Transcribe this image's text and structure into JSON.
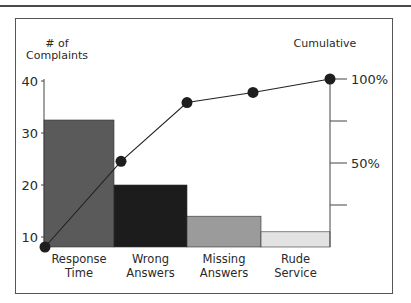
{
  "chart_data": {
    "type": "bar",
    "subtype": "pareto",
    "title": "",
    "categories": [
      "Response Time",
      "Wrong Answers",
      "Missing Answers",
      "Rude Service"
    ],
    "category_lines": [
      [
        "Response",
        "Time"
      ],
      [
        "Wrong",
        "Answers"
      ],
      [
        "Missing",
        "Answers"
      ],
      [
        "Rude",
        "Service"
      ]
    ],
    "series": [
      {
        "name": "# of Complaints",
        "type": "bar",
        "axis": "left",
        "values": [
          32.5,
          20,
          14,
          11
        ],
        "colors": [
          "#5a5a5a",
          "#1c1c1c",
          "#9b9b9b",
          "#e2e2e2"
        ]
      },
      {
        "name": "Cumulative",
        "type": "line",
        "axis": "right",
        "unit": "%",
        "points": [
          0,
          51,
          86,
          92,
          100
        ]
      }
    ],
    "ylabel": "# of Complaints",
    "ylabel_lines": [
      "# of",
      "Complaints"
    ],
    "y2label": "Cumulative",
    "yticks": [
      10,
      20,
      30,
      40
    ],
    "ytick_labels": [
      "10",
      "20",
      "30",
      "40"
    ],
    "ylim": [
      8,
      40
    ],
    "y2ticks": [
      25,
      50,
      75,
      100
    ],
    "y2tick_labels": [
      "",
      "50%",
      "",
      "100%"
    ],
    "y2lim": [
      0,
      100
    ],
    "grid": false,
    "legend": null
  }
}
